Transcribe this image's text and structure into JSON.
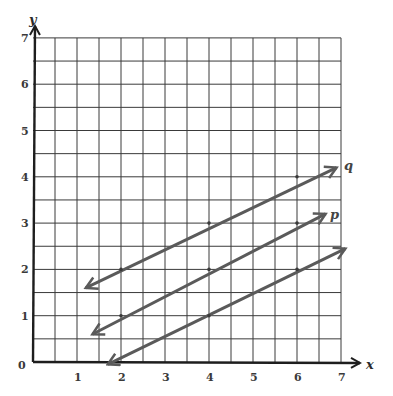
{
  "chart_data": {
    "type": "line",
    "title": "",
    "xlabel": "x",
    "ylabel": "y",
    "xlim": [
      0,
      7
    ],
    "ylim": [
      0,
      7
    ],
    "grid": true,
    "grid_step": 0.5,
    "x_ticks": [
      "0",
      "1",
      "2",
      "3",
      "4",
      "5",
      "6",
      "7"
    ],
    "y_ticks": [
      "1",
      "2",
      "3",
      "4",
      "5",
      "6",
      "7"
    ],
    "origin_label": "0",
    "series": [
      {
        "name": "q",
        "label": "q",
        "marked_points": [
          [
            2,
            2
          ],
          [
            4,
            3
          ],
          [
            6,
            4
          ]
        ],
        "start": [
          1.2,
          1.6
        ],
        "end": [
          6.9,
          4.2
        ],
        "arrows": "both"
      },
      {
        "name": "p",
        "label": "p",
        "marked_points": [
          [
            2,
            1
          ],
          [
            4,
            2
          ],
          [
            6,
            3
          ]
        ],
        "start": [
          1.35,
          0.6
        ],
        "end": [
          6.65,
          3.2
        ],
        "arrows": "both"
      },
      {
        "name": "unlabeled",
        "label": "",
        "marked_points": [
          [
            4,
            1
          ],
          [
            6,
            2
          ]
        ],
        "start": [
          1.7,
          -0.05
        ],
        "end": [
          7.1,
          2.45
        ],
        "arrows": "both"
      }
    ]
  },
  "labels": {
    "x_axis": "x",
    "y_axis": "y",
    "origin": "0",
    "line_q": "q",
    "line_p": "p"
  },
  "colors": {
    "grid": "#3a3a3a",
    "axis": "#1e1e1e",
    "lines": "#5a5a5a",
    "background": "#ffffff"
  }
}
